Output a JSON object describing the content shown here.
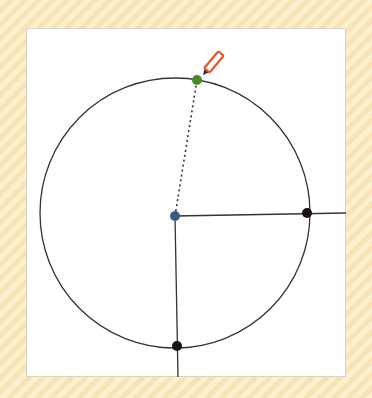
{
  "canvas": {
    "background": "#ffffff",
    "page_background_stripes": [
      "#fdf0cf",
      "#f8e3b4"
    ]
  },
  "drawing": {
    "circle": {
      "cx": 175,
      "cy": 213,
      "r": 135,
      "stroke": "#333333"
    },
    "center_point": {
      "x": 175,
      "y": 216,
      "color": "#3d5a8a"
    },
    "points": [
      {
        "name": "radius-endpoint-top",
        "x": 197,
        "y": 80,
        "color": "#4a8a2c"
      },
      {
        "name": "intersection-right",
        "x": 307,
        "y": 213,
        "color": "#1a0f14"
      },
      {
        "name": "intersection-bottom",
        "x": 177,
        "y": 346,
        "color": "#1a0f14"
      }
    ],
    "lines": [
      {
        "name": "dashed-radius",
        "x1": 175,
        "y1": 216,
        "x2": 197,
        "y2": 80,
        "style": "dotted"
      },
      {
        "name": "horizontal-ray",
        "x1": 175,
        "y1": 216,
        "x2": 346,
        "y2": 213,
        "style": "solid"
      },
      {
        "name": "vertical-ray",
        "x1": 175,
        "y1": 216,
        "x2": 178,
        "y2": 377,
        "style": "solid"
      }
    ],
    "cursor": {
      "icon": "pencil-icon",
      "x": 203,
      "y": 75,
      "color": "#e8542a"
    }
  }
}
